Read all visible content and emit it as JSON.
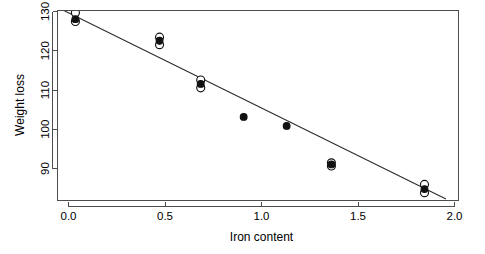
{
  "figure": {
    "width": 485,
    "height": 254,
    "background": "#ffffff",
    "foreground": "#000000",
    "frame_color": "#4d4d4d"
  },
  "chart_data": {
    "type": "scatter",
    "title": "",
    "xlabel": "Iron content",
    "ylabel": "Weight loss",
    "xlim": [
      -0.09,
      2.15
    ],
    "ylim": [
      82.2,
      130.6
    ],
    "xticks": [
      0.0,
      0.5,
      1.0,
      1.5,
      2.0
    ],
    "xtick_labels": [
      "0.0",
      "0.5",
      "1.0",
      "1.5",
      "2.0"
    ],
    "yticks": [
      90,
      100,
      110,
      120,
      130
    ],
    "ytick_labels": [
      "90",
      "100",
      "110",
      "120",
      "130"
    ],
    "grid": false,
    "legend": null,
    "legend_position": "none",
    "frame": "box",
    "series": [
      {
        "name": "observed",
        "marker": "open-circle",
        "marker_size": 4.0,
        "color": "#111111",
        "fill": "#ffffff",
        "points": [
          {
            "x": 0.01,
            "y": 130.0
          },
          {
            "x": 0.01,
            "y": 127.8
          },
          {
            "x": 0.48,
            "y": 123.8
          },
          {
            "x": 0.48,
            "y": 121.9
          },
          {
            "x": 0.71,
            "y": 112.9
          },
          {
            "x": 0.71,
            "y": 110.9
          },
          {
            "x": 1.44,
            "y": 91.8
          },
          {
            "x": 1.44,
            "y": 91.0
          },
          {
            "x": 1.96,
            "y": 86.3
          },
          {
            "x": 1.96,
            "y": 84.2
          }
        ]
      },
      {
        "name": "fitted",
        "marker": "filled-circle",
        "marker_size": 3.4,
        "color": "#111111",
        "fill": "#111111",
        "points": [
          {
            "x": 0.01,
            "y": 128.4
          },
          {
            "x": 0.48,
            "y": 122.9
          },
          {
            "x": 0.71,
            "y": 111.9
          },
          {
            "x": 0.95,
            "y": 103.5
          },
          {
            "x": 1.19,
            "y": 101.2
          },
          {
            "x": 1.44,
            "y": 91.4
          },
          {
            "x": 1.96,
            "y": 85.1
          }
        ]
      }
    ],
    "fit_line": {
      "name": "regression-line",
      "color": "#2b2b2b",
      "x_start": -0.09,
      "y_start": 131.4,
      "x_end": 2.08,
      "y_end": 82.6
    }
  }
}
